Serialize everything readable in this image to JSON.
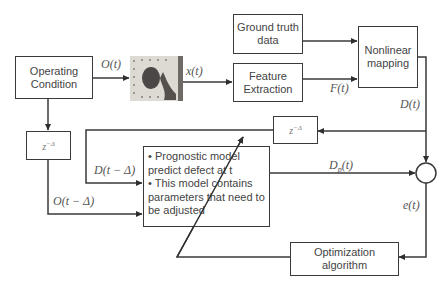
{
  "diagram": {
    "type": "block-diagram",
    "blocks": {
      "operating_condition": "Operating Condition",
      "ground_truth": "Ground truth data",
      "feature_extraction": "Feature Extraction",
      "nonlinear_mapping": "Nonlinear mapping",
      "delay_left": "z",
      "delay_left_exp": "−Δ",
      "delay_right": "z",
      "delay_right_exp": "−Δ",
      "optimization": "Optimization algorithm",
      "prognostic_model_lines": [
        "• Prognostic model",
        "predict defect at t",
        "• This model contains",
        "parameters that need to",
        "be adjusted"
      ],
      "specimen_image": "specimen-photo"
    },
    "signals": {
      "O_t": "O(t)",
      "x_t": "x(t)",
      "F_t": "F(t)",
      "D_t": "D(t)",
      "D_t_minus": "D(t − Δ)",
      "O_t_minus": "O(t − Δ)",
      "Dp_t_main": "D",
      "Dp_t_sub": "p",
      "Dp_t_arg": "(t)",
      "e_t": "e(t)"
    },
    "colors": {
      "line": "#3a3a3a",
      "background": "#ffffff"
    }
  }
}
